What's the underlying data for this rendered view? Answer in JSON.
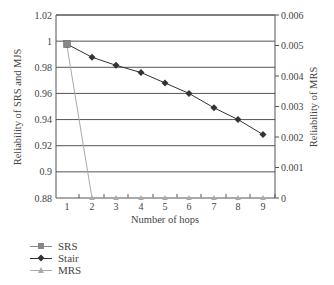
{
  "chart_data": {
    "type": "line",
    "title": "",
    "xlabel": "Number of hops",
    "ylabel": "Reliability of SRS and MJS",
    "y2label": "Reliability of MRS",
    "x": [
      1,
      2,
      3,
      4,
      5,
      6,
      7,
      8,
      9
    ],
    "xticks": [
      "1",
      "2",
      "3",
      "4",
      "5",
      "6",
      "7",
      "8",
      "9"
    ],
    "ylim": [
      0.88,
      1.02
    ],
    "yticks": [
      "0.88",
      "0.9",
      "0.92",
      "0.94",
      "0.96",
      "0.98",
      "1",
      "1.02"
    ],
    "y2lim": [
      0,
      0.006
    ],
    "y2ticks": [
      "0",
      "0.001",
      "0.002",
      "0.003",
      "0.004",
      "0.005",
      "0.006"
    ],
    "grid": true,
    "legend_position": "bottom-left",
    "series": [
      {
        "name": "SRS",
        "axis": "left",
        "marker": "square",
        "color": "#888888",
        "values": [
          0.998,
          null,
          null,
          null,
          null,
          null,
          null,
          null,
          null
        ]
      },
      {
        "name": "Stair",
        "axis": "left",
        "marker": "diamond",
        "color": "#333333",
        "values": [
          0.9977,
          0.9877,
          0.9815,
          0.976,
          0.968,
          0.96,
          0.949,
          0.94,
          0.9285
        ]
      },
      {
        "name": "MRS",
        "axis": "right",
        "marker": "triangle",
        "color": "#aaaaaa",
        "values": [
          0.00498,
          0,
          0,
          0,
          0,
          0,
          0,
          0,
          0
        ]
      }
    ]
  },
  "legend": {
    "items": [
      {
        "label": "SRS"
      },
      {
        "label": "Stair"
      },
      {
        "label": "MRS"
      }
    ]
  }
}
